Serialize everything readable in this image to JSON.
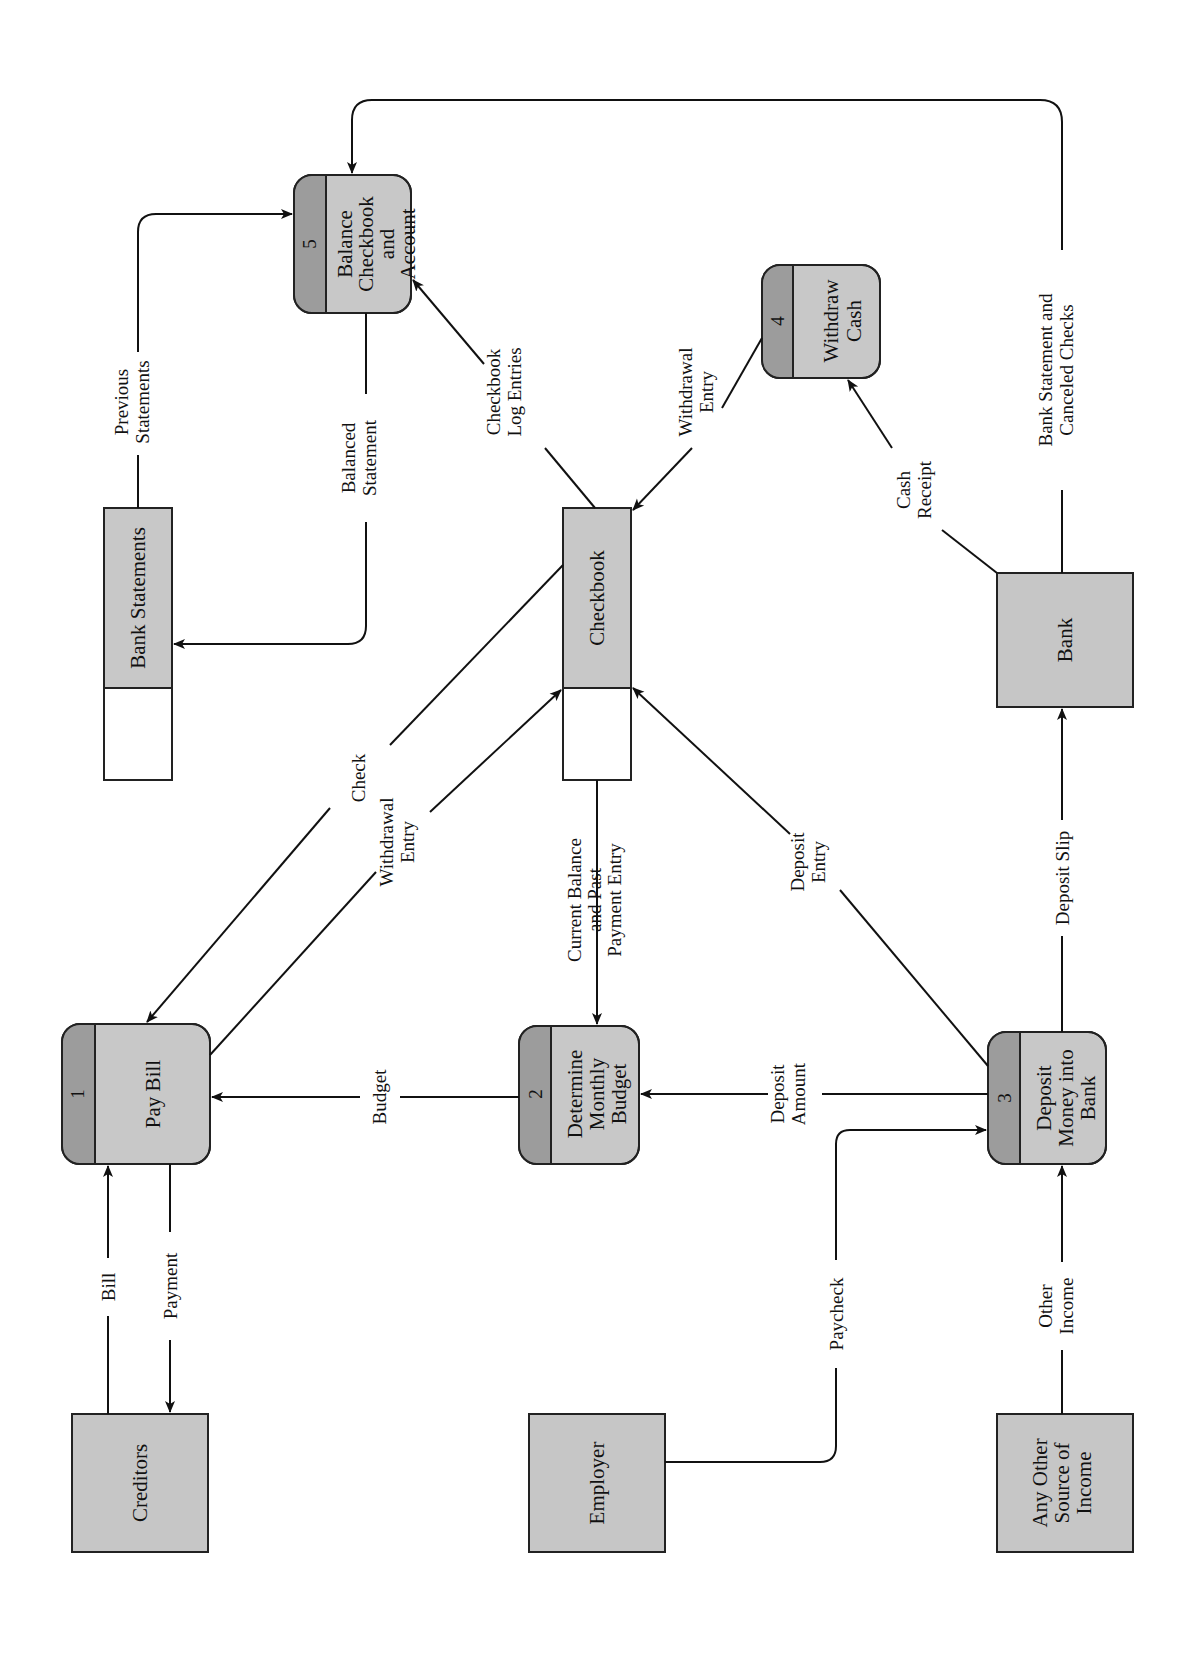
{
  "diagram": {
    "type": "data-flow-diagram",
    "orientation": "rotated-90-ccw",
    "colors": {
      "process_body": "#c8c8c8",
      "process_id": "#9c9c9c",
      "entity": "#c6c6c6",
      "line": "#111111"
    },
    "processes": [
      {
        "id": "1",
        "label": [
          "Pay Bill"
        ]
      },
      {
        "id": "2",
        "label": [
          "Determine",
          "Monthly",
          "Budget"
        ]
      },
      {
        "id": "3",
        "label": [
          "Deposit",
          "Money into",
          "Bank"
        ]
      },
      {
        "id": "4",
        "label": [
          "Withdraw",
          "Cash"
        ]
      },
      {
        "id": "5",
        "label": [
          "Balance",
          "Checkbook",
          "and",
          "Account"
        ]
      }
    ],
    "entities": [
      {
        "label": [
          "Creditors"
        ]
      },
      {
        "label": [
          "Employer"
        ]
      },
      {
        "label": [
          "Any Other",
          "Source of",
          "Income"
        ]
      },
      {
        "label": [
          "Bank"
        ]
      }
    ],
    "stores": [
      {
        "label": "Checkbook"
      },
      {
        "label": "Bank Statements"
      }
    ],
    "flows": [
      {
        "label": [
          "Bill"
        ]
      },
      {
        "label": [
          "Payment"
        ]
      },
      {
        "label": [
          "Check"
        ]
      },
      {
        "label": [
          "Withdrawal",
          "Entry"
        ]
      },
      {
        "label": [
          "Budget"
        ]
      },
      {
        "label": [
          "Current Balance",
          "and Past",
          "Payment Entry"
        ]
      },
      {
        "label": [
          "Deposit",
          "Amount"
        ]
      },
      {
        "label": [
          "Paycheck"
        ]
      },
      {
        "label": [
          "Other",
          "Income"
        ]
      },
      {
        "label": [
          "Deposit",
          "Entry"
        ]
      },
      {
        "label": [
          "Deposit Slip"
        ]
      },
      {
        "label": [
          "Cash",
          "Receipt"
        ]
      },
      {
        "label": [
          "Withdrawal",
          "Entry"
        ]
      },
      {
        "label": [
          "Checkbook",
          "Log Entries"
        ]
      },
      {
        "label": [
          "Balanced",
          "Statement"
        ]
      },
      {
        "label": [
          "Previous",
          "Statements"
        ]
      },
      {
        "label": [
          "Bank Statement and",
          "Canceled Checks"
        ]
      }
    ]
  }
}
